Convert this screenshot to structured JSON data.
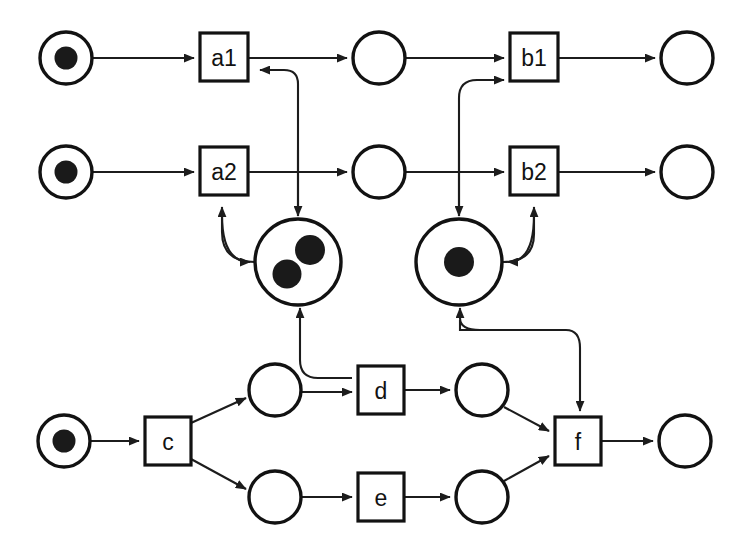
{
  "diagram": {
    "type": "petri-net",
    "width": 745,
    "height": 559,
    "background_color": "#ffffff",
    "line_color": "#1c1c1c",
    "token_color": "#1a1a1a"
  },
  "places": [
    {
      "id": "p_a1_in",
      "label": "",
      "cx": 66,
      "cy": 58,
      "r": 26,
      "double_ring": true,
      "tokens": 1
    },
    {
      "id": "p_a1_out",
      "label": "",
      "cx": 379,
      "cy": 58,
      "r": 26,
      "double_ring": false,
      "tokens": 0
    },
    {
      "id": "p_b1_out",
      "label": "",
      "cx": 687,
      "cy": 58,
      "r": 26,
      "double_ring": false,
      "tokens": 0
    },
    {
      "id": "p_a2_in",
      "label": "",
      "cx": 66,
      "cy": 172,
      "r": 26,
      "double_ring": true,
      "tokens": 1
    },
    {
      "id": "p_a2_out",
      "label": "",
      "cx": 379,
      "cy": 172,
      "r": 26,
      "double_ring": false,
      "tokens": 0
    },
    {
      "id": "p_b2_out",
      "label": "",
      "cx": 687,
      "cy": 172,
      "r": 26,
      "double_ring": false,
      "tokens": 0
    },
    {
      "id": "p_shared_left",
      "label": "",
      "cx": 298,
      "cy": 262,
      "r": 40,
      "double_ring": true,
      "tokens": 2
    },
    {
      "id": "p_shared_right",
      "label": "",
      "cx": 459,
      "cy": 262,
      "r": 40,
      "double_ring": true,
      "tokens": 1
    },
    {
      "id": "p_c_in",
      "label": "",
      "cx": 64,
      "cy": 441,
      "r": 26,
      "double_ring": true,
      "tokens": 1
    },
    {
      "id": "p_c_up",
      "label": "",
      "cx": 275,
      "cy": 390,
      "r": 26,
      "double_ring": false,
      "tokens": 0
    },
    {
      "id": "p_c_down",
      "label": "",
      "cx": 275,
      "cy": 497,
      "r": 26,
      "double_ring": false,
      "tokens": 0
    },
    {
      "id": "p_d_out",
      "label": "",
      "cx": 482,
      "cy": 390,
      "r": 26,
      "double_ring": false,
      "tokens": 0
    },
    {
      "id": "p_e_out",
      "label": "",
      "cx": 482,
      "cy": 497,
      "r": 26,
      "double_ring": false,
      "tokens": 0
    },
    {
      "id": "p_f_out",
      "label": "",
      "cx": 685,
      "cy": 441,
      "r": 26,
      "double_ring": false,
      "tokens": 0
    }
  ],
  "transitions": [
    {
      "id": "t_a1",
      "label": "a1",
      "x": 200,
      "y": 33,
      "w": 48,
      "h": 48
    },
    {
      "id": "t_b1",
      "label": "b1",
      "x": 510,
      "y": 33,
      "w": 48,
      "h": 48
    },
    {
      "id": "t_a2",
      "label": "a2",
      "x": 200,
      "y": 147,
      "w": 48,
      "h": 48
    },
    {
      "id": "t_b2",
      "label": "b2",
      "x": 510,
      "y": 147,
      "w": 48,
      "h": 48
    },
    {
      "id": "t_c",
      "label": "c",
      "x": 145,
      "y": 417,
      "w": 46,
      "h": 48
    },
    {
      "id": "t_d",
      "label": "d",
      "x": 358,
      "y": 366,
      "w": 46,
      "h": 48
    },
    {
      "id": "t_e",
      "label": "e",
      "x": 358,
      "y": 473,
      "w": 46,
      "h": 48
    },
    {
      "id": "t_f",
      "label": "f",
      "x": 555,
      "y": 417,
      "w": 46,
      "h": 48
    }
  ],
  "arcs": [
    {
      "id": "arc_pa1in_a1",
      "from": "p_a1_in",
      "to": "t_a1",
      "kind": "straight"
    },
    {
      "id": "arc_a1_pa1out",
      "from": "t_a1",
      "to": "p_a1_out",
      "kind": "straight"
    },
    {
      "id": "arc_pa1out_b1",
      "from": "p_a1_out",
      "to": "t_b1",
      "kind": "straight"
    },
    {
      "id": "arc_b1_pb1out",
      "from": "t_b1",
      "to": "p_b1_out",
      "kind": "straight"
    },
    {
      "id": "arc_pa2in_a2",
      "from": "p_a2_in",
      "to": "t_a2",
      "kind": "straight"
    },
    {
      "id": "arc_a2_pa2out",
      "from": "t_a2",
      "to": "p_a2_out",
      "kind": "straight"
    },
    {
      "id": "arc_pa2out_b2",
      "from": "p_a2_out",
      "to": "t_b2",
      "kind": "straight"
    },
    {
      "id": "arc_b2_pb2out",
      "from": "t_b2",
      "to": "p_b2_out",
      "kind": "straight"
    },
    {
      "id": "arc_sharedleft_a1",
      "from": "p_shared_left",
      "to": "t_a1",
      "kind": "curved-bidirectional"
    },
    {
      "id": "arc_sharedleft_a2",
      "from": "p_shared_left",
      "to": "t_a2",
      "kind": "curved-bidirectional"
    },
    {
      "id": "arc_sharedright_b1",
      "from": "p_shared_right",
      "to": "t_b1",
      "kind": "curved-bidirectional"
    },
    {
      "id": "arc_sharedright_b2",
      "from": "p_shared_right",
      "to": "t_b2",
      "kind": "curved-bidirectional"
    },
    {
      "id": "arc_pcin_c",
      "from": "p_c_in",
      "to": "t_c",
      "kind": "straight"
    },
    {
      "id": "arc_c_pcup",
      "from": "t_c",
      "to": "p_c_up",
      "kind": "straight"
    },
    {
      "id": "arc_c_pcdown",
      "from": "t_c",
      "to": "p_c_down",
      "kind": "straight"
    },
    {
      "id": "arc_pcup_d",
      "from": "p_c_up",
      "to": "t_d",
      "kind": "straight"
    },
    {
      "id": "arc_pcup_sharedleft",
      "from": "p_c_up",
      "to": "p_shared_left",
      "kind": "curved-bidirectional"
    },
    {
      "id": "arc_d_pdout",
      "from": "t_d",
      "to": "p_d_out",
      "kind": "straight"
    },
    {
      "id": "arc_pcdown_e",
      "from": "p_c_down",
      "to": "t_e",
      "kind": "straight"
    },
    {
      "id": "arc_e_peout",
      "from": "t_e",
      "to": "p_e_out",
      "kind": "straight"
    },
    {
      "id": "arc_pdout_f",
      "from": "p_d_out",
      "to": "t_f",
      "kind": "straight"
    },
    {
      "id": "arc_peout_f",
      "from": "p_e_out",
      "to": "t_f",
      "kind": "straight"
    },
    {
      "id": "arc_sharedright_f",
      "from": "p_shared_right",
      "to": "t_f",
      "kind": "curved-bidirectional"
    },
    {
      "id": "arc_f_pfout",
      "from": "t_f",
      "to": "p_f_out",
      "kind": "straight"
    }
  ]
}
